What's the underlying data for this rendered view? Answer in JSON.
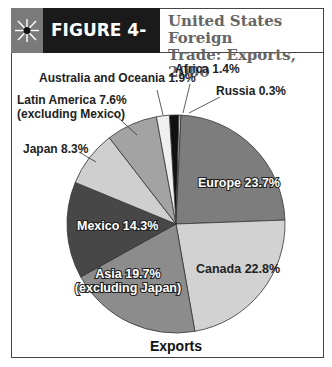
{
  "header": {
    "icon": "starburst-icon",
    "figure_label": "FIGURE 4-16",
    "title_line1": "United States Foreign",
    "title_line2": "Trade: Exports, 2000"
  },
  "chart_data": {
    "type": "pie",
    "title": "United States Foreign Trade: Exports, 2000",
    "caption": "Exports",
    "slices": [
      {
        "label": "Africa",
        "value": 1.4,
        "color": "#111111"
      },
      {
        "label": "Russia",
        "value": 0.3,
        "color": "#e0e0e0"
      },
      {
        "label": "Europe",
        "value": 23.7,
        "color": "#7d7d7d"
      },
      {
        "label": "Canada",
        "value": 22.8,
        "color": "#d2d2d2"
      },
      {
        "label": "Asia (excluding Japan)",
        "value": 19.7,
        "color": "#8c8c8c"
      },
      {
        "label": "Mexico",
        "value": 14.3,
        "color": "#474747"
      },
      {
        "label": "Japan",
        "value": 8.3,
        "color": "#cfcfcf"
      },
      {
        "label": "Latin America (excluding Mexico)",
        "value": 7.6,
        "color": "#a3a3a3"
      },
      {
        "label": "Australia and Oceania",
        "value": 1.9,
        "color": "#efefef"
      }
    ]
  },
  "labels": {
    "africa": "Africa 1.4%",
    "russia": "Russia 0.3%",
    "australia": "Australia and Oceania 1.9%",
    "latin1": "Latin America 7.6%",
    "latin2": "(excluding Mexico)",
    "japan": "Japan 8.3%",
    "europe": "Europe 23.7%",
    "canada": "Canada 22.8%",
    "mexico": "Mexico 14.3%",
    "asia1": "Asia 19.7%",
    "asia2": "(excluding Japan)",
    "caption": "Exports"
  }
}
